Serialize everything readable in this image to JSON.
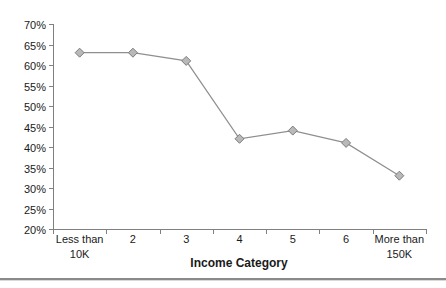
{
  "chart_data": {
    "type": "line",
    "categories": [
      "Less than\n10K",
      "2",
      "3",
      "4",
      "5",
      "6",
      "More than\n150K"
    ],
    "values": [
      63,
      63,
      61,
      42,
      44,
      41,
      33
    ],
    "title": "",
    "xlabel": "Income Category",
    "ylabel": "",
    "ylim": [
      20,
      70
    ],
    "ytick_step": 5,
    "ytick_labels": [
      "70%",
      "65%",
      "60%",
      "55%",
      "50%",
      "45%",
      "40%",
      "35%",
      "30%",
      "25%",
      "20%"
    ],
    "grid": false,
    "legend": "none",
    "marker": "diamond"
  },
  "colors": {
    "axis": "#808080",
    "series_line": "#8f8f8f",
    "marker_fill": "#b9b9b9",
    "marker_stroke": "#7c7c7c",
    "text": "#1a1a1a",
    "divider": "#8a8a8a",
    "divider_shadow": "#d9d9d9",
    "background": "#ffffff"
  }
}
